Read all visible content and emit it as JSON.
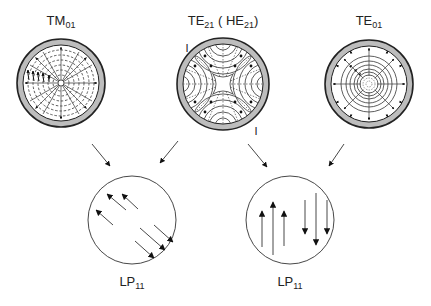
{
  "modes": [
    {
      "id": "tm01",
      "label_main": "TM",
      "label_sub": "01",
      "cx": 61,
      "cy": 83
    },
    {
      "id": "te21",
      "label_main": "TE",
      "label_sub": "21",
      "label_extra_open": " ( HE",
      "label_extra_sub": "21",
      "label_extra_close": ")",
      "cx": 223,
      "cy": 84
    },
    {
      "id": "te01",
      "label_main": "TE",
      "label_sub": "01",
      "cx": 369,
      "cy": 84
    }
  ],
  "lp_modes": [
    {
      "id": "lp11-left",
      "label_main": "LP",
      "label_sub": "11",
      "cx": 132,
      "cy": 220,
      "arrow_orientation": "diagonal"
    },
    {
      "id": "lp11-right",
      "label_main": "LP",
      "label_sub": "11",
      "cx": 290,
      "cy": 220,
      "arrow_orientation": "vertical"
    }
  ],
  "markers": {
    "te21_marker_top": "I",
    "te21_marker_bottom": "I"
  },
  "colors": {
    "stroke": "#222222",
    "cladding": "#bdbdbd",
    "dashed": "#333333"
  }
}
